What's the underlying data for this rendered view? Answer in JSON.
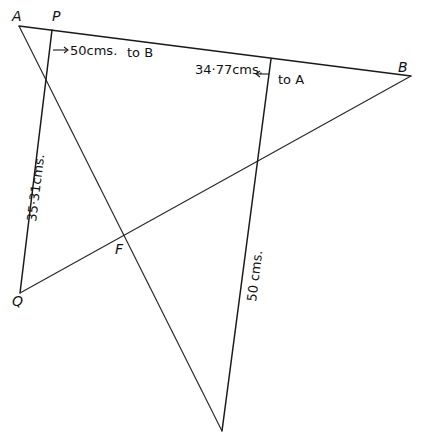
{
  "figure": {
    "points": {
      "A": {
        "label": "A",
        "x": 19,
        "y": 26
      },
      "P": {
        "label": "P",
        "x": 52,
        "y": 30
      },
      "B": {
        "label": "B",
        "x": 411,
        "y": 76
      },
      "Q": {
        "label": "Q",
        "x": 20,
        "y": 293
      },
      "F": {
        "label": "F",
        "x": 123,
        "y": 235
      },
      "V": {
        "label": "",
        "x": 222,
        "y": 431
      },
      "R": {
        "label": "",
        "x": 271,
        "y": 59
      }
    },
    "segments": [
      {
        "from": "A",
        "to": "B"
      },
      {
        "from": "A",
        "to": "V"
      },
      {
        "from": "P",
        "to": "Q"
      },
      {
        "from": "Q",
        "to": "B"
      },
      {
        "from": "R",
        "to": "V"
      }
    ],
    "annotations": {
      "pb_measure": "50cms.",
      "pb_direction": "to B",
      "ra_measure": "34·77cms.",
      "ra_direction": "to A",
      "pq_measure": "35·31cms.",
      "rv_measure": "50 cms."
    }
  }
}
